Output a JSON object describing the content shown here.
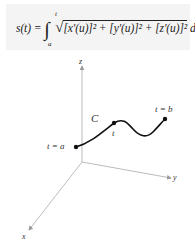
{
  "formula": {
    "lhs": "s(t) =",
    "integral_sign": "∫",
    "upper_limit": "t",
    "lower_limit": "a",
    "radical": "√",
    "integrand": "[x′(u)]² + [y′(u)]² + [z′(u)]²",
    "differential": "du"
  },
  "diagram": {
    "axes": {
      "x_label": "x",
      "y_label": "y",
      "z_label": "z"
    },
    "curve_label": "C",
    "points": [
      {
        "label": "t = a"
      },
      {
        "label": "t"
      },
      {
        "label": "t = b"
      }
    ],
    "colors": {
      "axis": "#999999",
      "curve": "#111111",
      "formula_bg": "#f4f4f4"
    }
  }
}
